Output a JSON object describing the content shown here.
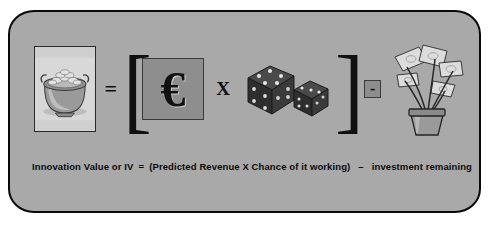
{
  "diagram": {
    "panel_color": "#a9a9a9",
    "border_color": "#0a0a0a",
    "symbols": {
      "equals": "=",
      "open_bracket": "[",
      "close_bracket": "]",
      "times": "X",
      "minus": "-",
      "euro": "€"
    },
    "icons": {
      "pot_of_gold": "pot-of-gold-icon",
      "euro_tile": "euro-currency-icon",
      "dice": "dice-pair-icon",
      "money_plant": "money-plant-icon"
    },
    "dice": {
      "left_face_value": 5,
      "right_face_value": 3
    }
  },
  "caption": {
    "label": "Innovation Value or IV",
    "equals": "=",
    "expression": "(Predicted Revenue  X  Chance of it working)",
    "minus": "–",
    "investment": "investment remaining"
  }
}
